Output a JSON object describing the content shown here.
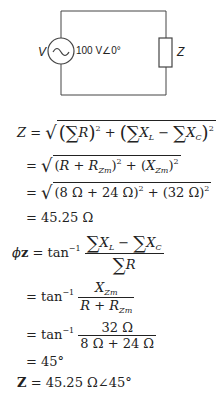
{
  "circuit": {
    "source_symbol": "V",
    "source_value": "100 V∠0°",
    "load_symbol": "Z",
    "icons": [
      "ac-source-icon",
      "impedance-box-icon"
    ]
  },
  "equations": {
    "line1": {
      "lhs": "Z =",
      "body": "√( (∑R)² + (∑X_L − ∑X_C)² )"
    },
    "line2": {
      "lhs": "=",
      "body": "√( (R + R_Zm)² + (X_Zm)² )"
    },
    "line3": {
      "lhs": "=",
      "body": "√( (8 Ω + 24 Ω)² + (32 Ω)² )"
    },
    "line4": {
      "lhs": "=",
      "body": "45.25 Ω"
    },
    "line5": {
      "lhs": "ϕz = tan⁻¹",
      "num": "∑X_L − ∑X_C",
      "den": "∑R"
    },
    "line6": {
      "lhs": "= tan⁻¹",
      "num": "X_Zm",
      "den": "R + R_Zm"
    },
    "line7": {
      "lhs": "= tan⁻¹",
      "num": "32 Ω",
      "den": "8 Ω + 24 Ω"
    },
    "line8": {
      "lhs": "=",
      "body": "45°"
    },
    "line9": {
      "lhs": "Z =",
      "body": "45.25 Ω∠45°"
    }
  },
  "text": {
    "eq_sign": "=",
    "Z": "Z",
    "R": "R",
    "X": "X",
    "L": "L",
    "C": "C",
    "Zm": "Zm",
    "sq": "2",
    "sigma": "∑",
    "minus": " − ",
    "plus": " + ",
    "lp": "(",
    "rp": ")",
    "sqrt": "√",
    "tan": "tan",
    "inv": "−1",
    "phi": "ϕ",
    "z_bold": "z",
    "Z_bold": "Z",
    "val_8_24": "8 Ω + 24 Ω",
    "val_32": "32 Ω",
    "result_mag": "45.25 Ω",
    "result_angle": "45°",
    "result_polar": "45.25 Ω∠45°"
  }
}
